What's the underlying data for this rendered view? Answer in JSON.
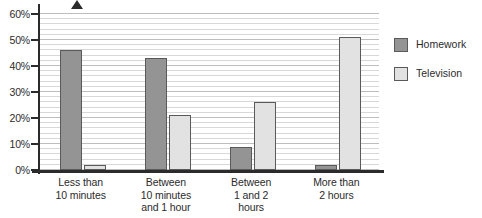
{
  "chart_data": {
    "type": "bar",
    "title": "",
    "xlabel": "",
    "ylabel": "",
    "ylim": [
      0,
      60
    ],
    "yticks": [
      0,
      10,
      20,
      30,
      40,
      50,
      60
    ],
    "ytick_labels": [
      "0%",
      "10%",
      "20%",
      "30%",
      "40%",
      "50%",
      "60%"
    ],
    "minor_gridlines": true,
    "minor_gridline_step": 2,
    "grid": true,
    "legend_position": "right",
    "categories": [
      "Less than\n10 minutes",
      "Between\n10 minutes\nand 1 hour",
      "Between\n1 and 2\nhours",
      "More than\n2 hours"
    ],
    "category_lines": [
      [
        "Less than",
        "10 minutes"
      ],
      [
        "Between",
        "10 minutes",
        "and 1 hour"
      ],
      [
        "Between",
        "1 and 2",
        "hours"
      ],
      [
        "More than",
        "2 hours"
      ]
    ],
    "series": [
      {
        "name": "Homework",
        "color": "#949494",
        "values": [
          46,
          43,
          9,
          2
        ]
      },
      {
        "name": "Television",
        "color": "#e2e2e2",
        "values": [
          2,
          21,
          26,
          51
        ]
      }
    ]
  },
  "legend": {
    "items": [
      {
        "label": "Homework",
        "color": "#949494"
      },
      {
        "label": "Television",
        "color": "#e2e2e2"
      }
    ]
  },
  "colors": {
    "homework": "#949494",
    "television": "#e2e2e2",
    "axis": "#2b2b2b",
    "gridline_major": "#bdbdbd",
    "gridline_minor": "#d8d8d8",
    "background": "#ffffff"
  }
}
